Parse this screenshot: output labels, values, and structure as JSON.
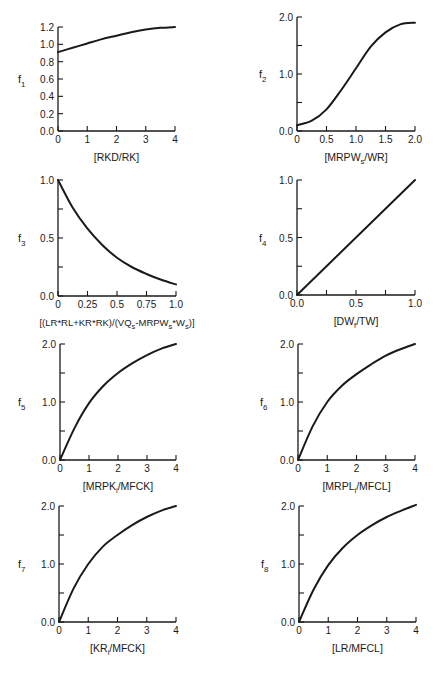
{
  "figure": {
    "layout": "4 rows x 2 columns grid of function curves",
    "ink_color": "#1a1a1a",
    "background": "#ffffff"
  },
  "chart_data": [
    {
      "id": "f1",
      "type": "line",
      "ylabel": "f",
      "ylabel_sub": "1",
      "xlabel": "[RKD/RK]",
      "xlim": [
        0,
        4
      ],
      "ylim": [
        0,
        1.2
      ],
      "xticks": [
        0,
        1,
        2,
        3,
        4
      ],
      "xtick_labels": [
        "0",
        "1",
        "2",
        "3",
        "4"
      ],
      "yticks": [
        0,
        0.2,
        0.4,
        0.6,
        0.8,
        1.0,
        1.2
      ],
      "ytick_labels": [
        "0.0",
        "0.2",
        "0.4",
        "0.6",
        "0.8",
        "1.0",
        "1.2"
      ],
      "x": [
        0,
        0.5,
        1,
        1.5,
        2,
        2.5,
        3,
        3.5,
        4
      ],
      "y": [
        0.91,
        0.96,
        1.01,
        1.06,
        1.1,
        1.14,
        1.17,
        1.19,
        1.2
      ],
      "plot_box": [
        58,
        27,
        175,
        131
      ]
    },
    {
      "id": "f2",
      "type": "line",
      "ylabel": "f",
      "ylabel_sub": "2",
      "xlabel": "[MRPW",
      "xlabel_sub": "s",
      "xlabel_tail": "/WR]",
      "xlim": [
        0,
        2
      ],
      "ylim": [
        0,
        2
      ],
      "xticks": [
        0,
        0.5,
        1.0,
        1.5,
        2.0
      ],
      "xtick_labels": [
        "0",
        "0.5",
        "1.0",
        "1.5",
        "2.0"
      ],
      "yticks": [
        0,
        0.5,
        1.0,
        1.5,
        2.0
      ],
      "ytick_labels": [
        "0.0",
        "",
        "1.0",
        "",
        "2.0"
      ],
      "x": [
        0,
        0.25,
        0.5,
        0.75,
        1.0,
        1.25,
        1.5,
        1.75,
        2.0
      ],
      "y": [
        0.1,
        0.18,
        0.38,
        0.72,
        1.1,
        1.48,
        1.73,
        1.87,
        1.9
      ],
      "plot_box": [
        297,
        17,
        415,
        131
      ]
    },
    {
      "id": "f3",
      "type": "line",
      "ylabel": "f",
      "ylabel_sub": "3",
      "xlabel": "[(LR*RL+KR*RK)/(VQ",
      "xlabel_sub": "s",
      "xlabel_mid": "-MRPW",
      "xlabel_sub2": "s",
      "xlabel_mid2": "*W",
      "xlabel_sub3": "s",
      "xlabel_tail": ")]",
      "xlim": [
        0,
        1
      ],
      "ylim": [
        0,
        1
      ],
      "xticks": [
        0,
        0.25,
        0.5,
        0.75,
        1.0
      ],
      "xtick_labels": [
        "0",
        "0.25",
        "0.5",
        "0.75",
        "1.0"
      ],
      "yticks": [
        0,
        0.25,
        0.5,
        0.75,
        1.0
      ],
      "ytick_labels": [
        "0.0",
        "",
        "0.5",
        "",
        "1.0"
      ],
      "x": [
        0,
        0.125,
        0.25,
        0.375,
        0.5,
        0.625,
        0.75,
        0.875,
        1.0
      ],
      "y": [
        1.0,
        0.76,
        0.58,
        0.44,
        0.33,
        0.25,
        0.19,
        0.14,
        0.1
      ],
      "plot_box": [
        58,
        180,
        176,
        296
      ]
    },
    {
      "id": "f4",
      "type": "line",
      "ylabel": "f",
      "ylabel_sub": "4",
      "xlabel": "[DW",
      "xlabel_sub": "f",
      "xlabel_tail": "/TW]",
      "xlim": [
        0,
        1
      ],
      "ylim": [
        0,
        1
      ],
      "xticks": [
        0,
        0.25,
        0.5,
        0.75,
        1.0
      ],
      "xtick_labels": [
        "0.0",
        "",
        "0.5",
        "",
        "1.0"
      ],
      "yticks": [
        0,
        0.25,
        0.5,
        0.75,
        1.0
      ],
      "ytick_labels": [
        "0.0",
        "",
        "0.5",
        "",
        "1.0"
      ],
      "x": [
        0,
        1.0
      ],
      "y": [
        0,
        1.0
      ],
      "plot_box": [
        297,
        180,
        415,
        295
      ]
    },
    {
      "id": "f5",
      "type": "line",
      "ylabel": "f",
      "ylabel_sub": "5",
      "xlabel": "[MRPK",
      "xlabel_sub": "i",
      "xlabel_tail": "/MFCK]",
      "xlim": [
        0,
        4
      ],
      "ylim": [
        0,
        2
      ],
      "xticks": [
        0,
        1,
        2,
        3,
        4
      ],
      "xtick_labels": [
        "0",
        "1",
        "2",
        "3",
        "4"
      ],
      "yticks": [
        0,
        0.5,
        1.0,
        1.5,
        2.0
      ],
      "ytick_labels": [
        "0.0",
        "",
        "1.0",
        "",
        "2.0"
      ],
      "x": [
        0,
        0.5,
        1,
        1.5,
        2,
        2.5,
        3,
        3.5,
        4
      ],
      "y": [
        0,
        0.55,
        0.98,
        1.28,
        1.5,
        1.67,
        1.81,
        1.92,
        2.0
      ],
      "plot_box": [
        60,
        344,
        176,
        460
      ]
    },
    {
      "id": "f6",
      "type": "line",
      "ylabel": "f",
      "ylabel_sub": "6",
      "xlabel": "[MRPL",
      "xlabel_sub": "i",
      "xlabel_tail": "/MFCL]",
      "xlim": [
        0,
        4
      ],
      "ylim": [
        0,
        2
      ],
      "xticks": [
        0,
        1,
        2,
        3,
        4
      ],
      "xtick_labels": [
        "0",
        "1",
        "2",
        "3",
        "4"
      ],
      "yticks": [
        0,
        0.5,
        1.0,
        1.5,
        2.0
      ],
      "ytick_labels": [
        "0.0",
        "",
        "1.0",
        "",
        "2.0"
      ],
      "x": [
        0,
        0.5,
        1,
        1.5,
        2,
        2.5,
        3,
        3.5,
        4
      ],
      "y": [
        0,
        0.58,
        1.0,
        1.28,
        1.48,
        1.65,
        1.8,
        1.91,
        2.0
      ],
      "plot_box": [
        298,
        344,
        415,
        460
      ]
    },
    {
      "id": "f7",
      "type": "line",
      "ylabel": "f",
      "ylabel_sub": "7",
      "xlabel": "[KR",
      "xlabel_sub": "i",
      "xlabel_tail": "/MFCK]",
      "xlim": [
        0,
        4
      ],
      "ylim": [
        0,
        2
      ],
      "xticks": [
        0,
        1,
        2,
        3,
        4
      ],
      "xtick_labels": [
        "0",
        "1",
        "2",
        "3",
        "4"
      ],
      "yticks": [
        0,
        0.5,
        1.0,
        1.5,
        2.0
      ],
      "ytick_labels": [
        "0.0",
        "",
        "1.0",
        "",
        "2.0"
      ],
      "x": [
        0,
        0.5,
        1,
        1.5,
        2,
        2.5,
        3,
        3.5,
        4
      ],
      "y": [
        0,
        0.58,
        1.0,
        1.3,
        1.5,
        1.67,
        1.81,
        1.92,
        2.0
      ],
      "plot_box": [
        59,
        506,
        176,
        622
      ]
    },
    {
      "id": "f8",
      "type": "line",
      "ylabel": "f",
      "ylabel_sub": "8",
      "xlabel": "[LR/MFCL]",
      "xlim": [
        0,
        4
      ],
      "ylim": [
        0,
        2
      ],
      "xticks": [
        0,
        1,
        2,
        3,
        4
      ],
      "xtick_labels": [
        "0",
        "1",
        "2",
        "3",
        "4"
      ],
      "yticks": [
        0,
        0.5,
        1.0,
        1.5,
        2.0
      ],
      "ytick_labels": [
        "0.0",
        "",
        "1.0",
        "",
        "2.0"
      ],
      "x": [
        0,
        0.5,
        1,
        1.5,
        2,
        2.5,
        3,
        3.5,
        4
      ],
      "y": [
        0,
        0.56,
        0.98,
        1.28,
        1.5,
        1.67,
        1.81,
        1.92,
        2.02
      ],
      "plot_box": [
        299,
        506,
        416,
        622
      ]
    }
  ]
}
